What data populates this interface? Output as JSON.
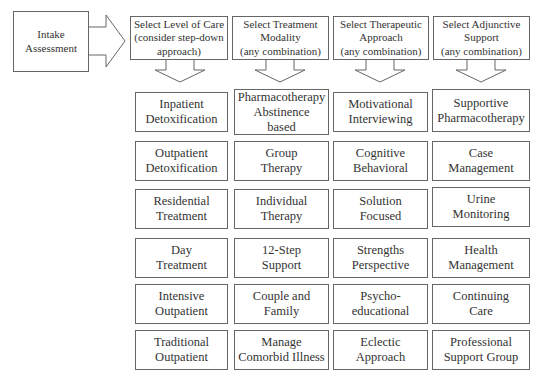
{
  "intake": {
    "label": "Intake\nAssessment"
  },
  "columns": [
    {
      "header": "Select Level of Care\n(consider step-down\napproach)",
      "items": [
        "Inpatient\nDetoxification",
        "Outpatient\nDetoxification",
        "Residential\nTreatment",
        "Day\nTreatment",
        "Intensive\nOutpatient",
        "Traditional\nOutpatient"
      ]
    },
    {
      "header": "Select Treatment\nModality\n(any combination)",
      "items": [
        "Pharmacotherapy\nAbstinence\nbased",
        "Group\nTherapy",
        "Individual\nTherapy",
        "12-Step\nSupport",
        "Couple and\nFamily",
        "Manage\nComorbid Illness"
      ]
    },
    {
      "header": "Select Therapeutic\nApproach\n(any combination)",
      "items": [
        "Motivational\nInterviewing",
        "Cognitive\nBehavioral",
        "Solution\nFocused",
        "Strengths\nPerspective",
        "Psycho-\neducational",
        "Eclectic\nApproach"
      ]
    },
    {
      "header": "Select Adjunctive\nSupport\n(any combination)",
      "items": [
        "Supportive\nPharmacotherapy",
        "Case\nManagement",
        "Urine\nMonitoring",
        "Health\nManagement",
        "Continuing\nCare",
        "Professional\nSupport Group"
      ]
    }
  ],
  "colors": {
    "border": "#666666",
    "text": "#333333",
    "background": "#ffffff"
  }
}
